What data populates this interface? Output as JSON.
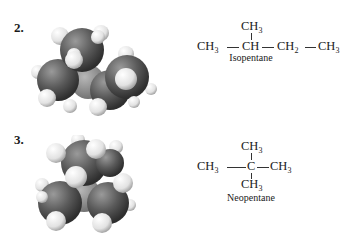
{
  "items": [
    {
      "number": "2.",
      "name": "Isopentane",
      "formula": {
        "top": "CH3",
        "main_row": [
          "CH3",
          "CH",
          "CH2",
          "CH3"
        ]
      },
      "model_icon": "space-filling-model-isopentane"
    },
    {
      "number": "3.",
      "name": "Neopentane",
      "formula": {
        "top": "CH3",
        "main_row": [
          "CH3",
          "C",
          "CH3"
        ],
        "bottom": "CH3"
      },
      "model_icon": "space-filling-model-neopentane"
    }
  ],
  "colors": {
    "carbon": "#5a5a5a",
    "hydrogen": "#e8e8e8",
    "text": "#1a1a1a"
  }
}
